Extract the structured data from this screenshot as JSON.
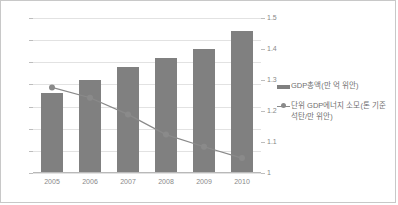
{
  "chart_data": {
    "type": "bar",
    "title": "",
    "subtitle": "",
    "xlabel": "",
    "ylabel": "",
    "categories": [
      "2005",
      "2006",
      "2007",
      "2008",
      "2009",
      "2010"
    ],
    "grid": true,
    "legend_position": "right",
    "axes": {
      "left": {
        "ylim": [
          0,
          35
        ],
        "ticks": [
          "0",
          "5",
          "10",
          "15",
          "20",
          "25",
          "30",
          "35"
        ],
        "tick_values": [
          0,
          5,
          10,
          15,
          20,
          25,
          30,
          35
        ]
      },
      "right": {
        "ylim": [
          1,
          1.5
        ],
        "ticks": [
          "1",
          "1.1",
          "1.2",
          "1.3",
          "1.4",
          "1.5"
        ],
        "tick_values": [
          1,
          1.1,
          1.2,
          1.3,
          1.4,
          1.5
        ]
      }
    },
    "series": [
      {
        "name": "GDP총액(만 억 위안)",
        "type": "bar",
        "axis": "left",
        "color": "#808080",
        "values": [
          18,
          21,
          24,
          26,
          28,
          32
        ]
      },
      {
        "name": "단위 GDP에너지 소모(톤 기준 석탄/만 위안)",
        "type": "line",
        "axis": "right",
        "color": "#8a8a8a",
        "values": [
          1.276,
          1.243,
          1.189,
          1.124,
          1.085,
          1.048
        ]
      }
    ]
  },
  "legend": {
    "entries": [
      {
        "label": "GDP총액(만 억 위안)",
        "marker": "bar-swatch"
      },
      {
        "label": "단위 GDP에너지 소모(톤 기준\n석탄/만 위안)",
        "marker": "line-swatch"
      }
    ]
  }
}
